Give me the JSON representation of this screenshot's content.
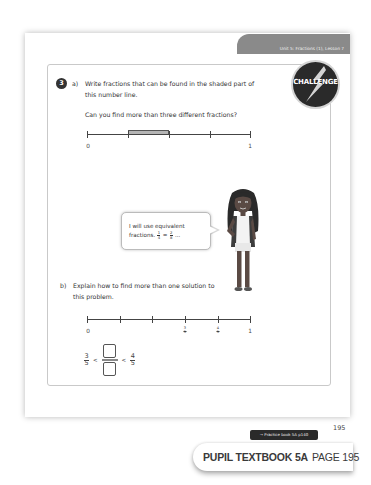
{
  "header": {
    "unit_tab": "Unit 5: Fractions (1), Lesson 7"
  },
  "badge": {
    "label": "CHALLENGE",
    "icon": "lightning-bolt-icon"
  },
  "question": {
    "number": "3",
    "part_a": {
      "label": "a)",
      "line1": "Write fractions that can be found in the shaded part of",
      "line2": "this number line.",
      "prompt": "Can you find more than three different fractions?",
      "number_line": {
        "segments": 4,
        "shaded_segment_index": 1,
        "labels": {
          "start": "0",
          "end": "1"
        }
      }
    },
    "speech_bubble": {
      "line1": "I will use equivalent",
      "line2_prefix": "fractions.",
      "frac1": {
        "num": "1",
        "den": "4"
      },
      "equals": "=",
      "frac2": {
        "num": "2",
        "den": "8"
      },
      "ellipsis": "..."
    },
    "part_b": {
      "label": "b)",
      "line1": "Explain how to find more than one solution to",
      "line2": "this problem.",
      "number_line": {
        "segments": 5,
        "labels": {
          "start": "0",
          "end": "1",
          "three_fifths": {
            "num": "3",
            "den": "5"
          },
          "four_fifths": {
            "num": "4",
            "den": "5"
          }
        }
      },
      "inequality": {
        "left": {
          "num": "3",
          "den": "5"
        },
        "op1": "<",
        "op2": "<",
        "right": {
          "num": "4",
          "den": "5"
        }
      }
    }
  },
  "footer": {
    "page_number": "195",
    "practice_link": "→ Practice book 5A p140",
    "book_title": "PUPIL TEXTBOOK 5A",
    "page_label": "PAGE 195"
  }
}
